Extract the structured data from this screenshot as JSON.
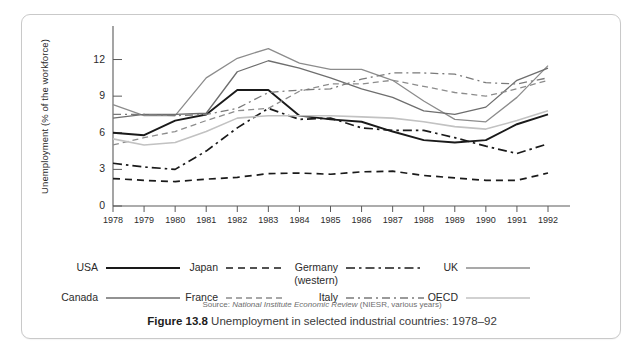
{
  "figure": {
    "caption_number": "Figure 13.8",
    "caption_text": "Unemployment in selected industrial countries: 1978–92",
    "source_prefix": "Source:",
    "source_italic": "National Institute Economic Review",
    "source_suffix": "(NIESR, various years)"
  },
  "chart_data": {
    "type": "line",
    "title": "Unemployment in selected industrial countries: 1978–92",
    "xlabel": "",
    "ylabel": "Unemployment (% of the workforce)",
    "x": [
      1978,
      1979,
      1980,
      1981,
      1982,
      1983,
      1984,
      1985,
      1986,
      1987,
      1988,
      1989,
      1990,
      1991,
      1992
    ],
    "xtick_labels": [
      "1978",
      "1979",
      "1980",
      "1981",
      "1982",
      "1983",
      "1984",
      "1985",
      "1986",
      "1987",
      "1988",
      "1989",
      "1990",
      "1991",
      "1992"
    ],
    "ytick_labels": [
      "0",
      "3",
      "6",
      "9",
      "12"
    ],
    "yticks": [
      0,
      3,
      6,
      9,
      12
    ],
    "ylim": [
      0,
      13.6
    ],
    "xlim": [
      1978,
      1992
    ],
    "grid": false,
    "legend_position": "below",
    "series": [
      {
        "name": "USA",
        "style": "solid",
        "color": "#1a1a1a",
        "width": 1.9,
        "values": [
          6.0,
          5.8,
          7.0,
          7.5,
          9.5,
          9.5,
          7.4,
          7.1,
          6.9,
          6.1,
          5.4,
          5.2,
          5.4,
          6.7,
          7.5
        ]
      },
      {
        "name": "Japan",
        "style": "dashed",
        "color": "#1a1a1a",
        "width": 1.7,
        "values": [
          2.25,
          2.1,
          2.0,
          2.2,
          2.35,
          2.65,
          2.7,
          2.6,
          2.8,
          2.85,
          2.5,
          2.3,
          2.1,
          2.1,
          2.7
        ]
      },
      {
        "name": "Germany (western)",
        "style": "dashdot",
        "color": "#1a1a1a",
        "width": 1.7,
        "values": [
          3.5,
          3.2,
          3.0,
          4.5,
          6.4,
          8.0,
          7.1,
          7.2,
          6.4,
          6.2,
          6.2,
          5.6,
          4.9,
          4.3,
          5.1
        ]
      },
      {
        "name": "UK",
        "style": "solid",
        "color": "#8c8c8c",
        "width": 1.3,
        "values": [
          8.3,
          7.4,
          7.4,
          10.5,
          12.1,
          12.9,
          11.7,
          11.2,
          11.2,
          10.3,
          8.6,
          7.1,
          6.9,
          8.9,
          11.5
        ]
      },
      {
        "name": "Canada",
        "style": "solid",
        "color": "#6e6e6e",
        "width": 1.3,
        "values": [
          7.2,
          7.5,
          7.5,
          7.6,
          11.0,
          11.9,
          11.3,
          10.5,
          9.6,
          8.9,
          7.8,
          7.5,
          8.1,
          10.3,
          11.3
        ]
      },
      {
        "name": "France",
        "style": "dashed",
        "color": "#8c8c8c",
        "width": 1.3,
        "values": [
          5.0,
          5.6,
          6.1,
          7.0,
          7.8,
          8.0,
          9.4,
          10.0,
          10.0,
          10.3,
          9.8,
          9.3,
          9.0,
          9.6,
          10.3
        ]
      },
      {
        "name": "Italy",
        "style": "dashdot",
        "color": "#7a7a7a",
        "width": 1.3,
        "values": [
          7.5,
          7.5,
          7.4,
          7.5,
          8.0,
          9.3,
          9.5,
          9.6,
          10.4,
          10.9,
          10.9,
          10.8,
          10.1,
          10.0,
          10.5
        ]
      },
      {
        "name": "OECD",
        "style": "solid",
        "color": "#c2c2c2",
        "width": 1.6,
        "values": [
          5.5,
          5.0,
          5.2,
          6.1,
          7.2,
          7.4,
          7.4,
          7.4,
          7.3,
          7.2,
          6.9,
          6.5,
          6.3,
          7.0,
          7.8
        ]
      }
    ]
  },
  "legend": {
    "row1": [
      {
        "label": "USA",
        "series": "USA"
      },
      {
        "label": "Japan",
        "series": "Japan"
      },
      {
        "label": "Germany",
        "label2": "(western)",
        "series": "Germany (western)"
      },
      {
        "label": "UK",
        "series": "UK"
      }
    ],
    "row2": [
      {
        "label": "Canada",
        "series": "Canada"
      },
      {
        "label": "France",
        "series": "France"
      },
      {
        "label": "Italy",
        "series": "Italy"
      },
      {
        "label": "OECD",
        "series": "OECD"
      }
    ]
  }
}
